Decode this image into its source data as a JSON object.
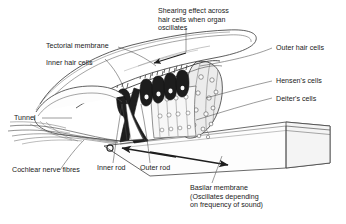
{
  "figure": {
    "colors": {
      "ink": "#2b2b2b",
      "line": "#3a3a3a",
      "fill_light": "#f2f2f2",
      "fill_mid": "#dcdcdc",
      "fill_dark": "#1e1e1e",
      "background": "#ffffff",
      "text": "#1a1a1a"
    }
  },
  "labels": {
    "shearing_effect": "Shearing effect across\nhair cells when organ\noscillates",
    "tectorial_membrane": "Tectorial membrane",
    "inner_hair_cells": "Inner hair cells",
    "outer_hair_cells": "Outer hair cells",
    "hensens_cells": "Hensen's cells",
    "deiters_cells": "Deiter's cells",
    "tunnel": "Tunnel",
    "cochlear_nerve_fibres": "Cochlear nerve fibres",
    "inner_rod": "Inner rod",
    "outer_rod": "Outer rod",
    "basilar_membrane": "Basilar membrane\n(Oscillates depending\non frequency of sound)"
  }
}
